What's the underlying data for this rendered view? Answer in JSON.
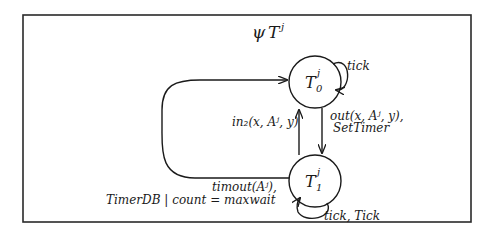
{
  "diagram": {
    "title": {
      "symbol": "ψ",
      "base": "T",
      "sup": "j"
    },
    "states": [
      {
        "id": "T0",
        "base": "T",
        "sub": "0",
        "sup": "j"
      },
      {
        "id": "T1",
        "base": "T",
        "sub": "1",
        "sup": "j"
      }
    ],
    "transitions": [
      {
        "from": "T0",
        "to": "T0",
        "label": "tick"
      },
      {
        "from": "T0",
        "to": "T1",
        "label_line1": "out(x, Aʲ, y),",
        "label_line2": "SetTimer"
      },
      {
        "from": "T1",
        "to": "T0",
        "label": "in₂(x, Aʲ, y)"
      },
      {
        "from": "T1",
        "to": "T0",
        "label_line1": "timout(Aʲ),",
        "label_line2": "TimerDB | count = maxwait"
      },
      {
        "from": "T1",
        "to": "T1",
        "label": "tick, Tick"
      }
    ]
  }
}
